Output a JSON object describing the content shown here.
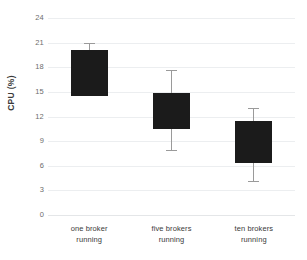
{
  "chart_data": {
    "type": "bar",
    "title": "",
    "subtitle": "",
    "xlabel": "",
    "ylabel": "CPU (%)",
    "categories": [
      "one broker running",
      "five brokers running",
      "ten brokers running"
    ],
    "category_lines": [
      [
        "one broker",
        "running"
      ],
      [
        "five brokers",
        "running"
      ],
      [
        "ten brokers",
        "running"
      ]
    ],
    "bar_bottoms": [
      14.5,
      10.5,
      6.3
    ],
    "bar_tops": [
      20.1,
      14.9,
      11.5
    ],
    "values": [
      20.1,
      14.9,
      11.5
    ],
    "error_low": [
      14.9,
      7.9,
      4.2
    ],
    "error_high": [
      20.9,
      17.7,
      13.0
    ],
    "ylim": [
      0,
      24
    ],
    "yticks": [
      0,
      3,
      6,
      9,
      12,
      15,
      18,
      21,
      24
    ],
    "ytick_labels": [
      "0",
      "3",
      "6",
      "9",
      "12",
      "15",
      "18",
      "21",
      "24"
    ],
    "grid": true,
    "grid_axis": "y",
    "legend": false,
    "legend_position": "none",
    "colors": {
      "bar": "#1b1b1b",
      "whisker": "#9a9a9a",
      "gridline": "#eceef0",
      "tick_text": "#6d6d6d",
      "label_text": "#3a3a3a",
      "background": "#ffffff"
    }
  }
}
